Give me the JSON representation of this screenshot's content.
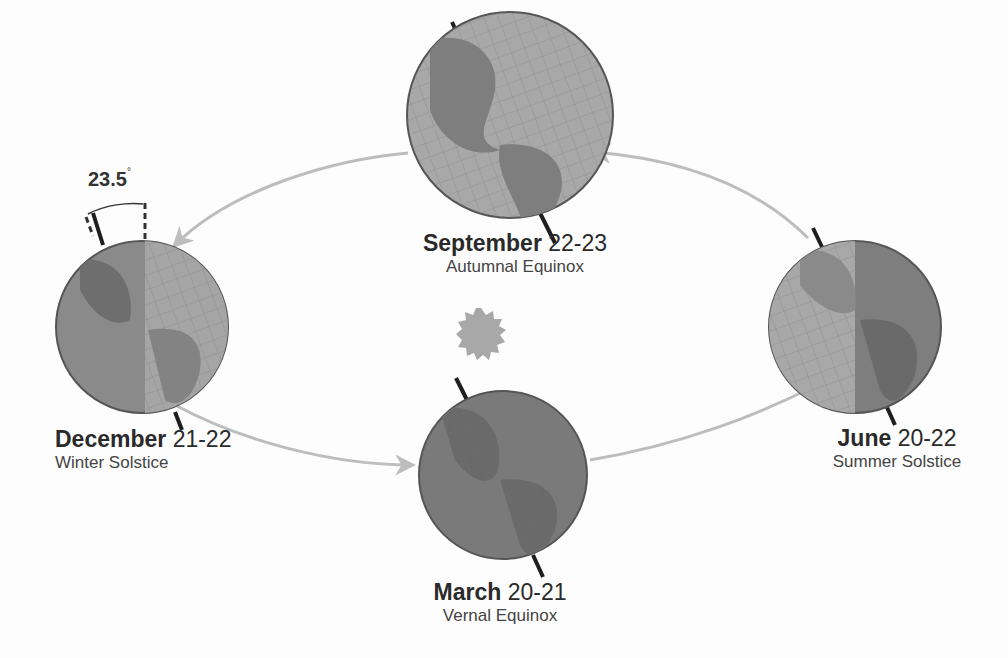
{
  "diagram": {
    "tilt_label": "23.5",
    "tilt_unit": "°",
    "positions": [
      {
        "id": "september",
        "month": "September",
        "days": "22-23",
        "event": "Autumnal Equinox"
      },
      {
        "id": "june",
        "month": "June",
        "days": "20-22",
        "event": "Summer Solstice"
      },
      {
        "id": "march",
        "month": "March",
        "days": "20-21",
        "event": "Vernal Equinox"
      },
      {
        "id": "december",
        "month": "December",
        "days": "21-22",
        "event": "Winter Solstice"
      }
    ],
    "colors": {
      "orbit": "#bdbdbd",
      "earth_light": "#9e9e9e",
      "earth_dark": "#6b6b6b",
      "sun": "#a8a8a8",
      "axis": "#1e1e1e",
      "text": "#2a2a2a"
    }
  }
}
